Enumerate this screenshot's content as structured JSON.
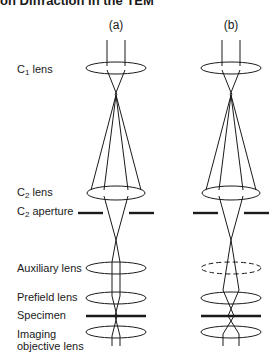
{
  "header": {
    "title": "on Diffraction in the TEM"
  },
  "panels": [
    {
      "id": "a",
      "label": "(a)",
      "center_x": 116,
      "auxiliary_lens_style": "solid"
    },
    {
      "id": "b",
      "label": "(b)",
      "center_x": 231,
      "auxiliary_lens_style": "dashed"
    }
  ],
  "labels": {
    "c1_lens": {
      "main": "C",
      "sub": "1",
      "rest": " lens"
    },
    "c2_lens": {
      "main": "C",
      "sub": "2",
      "rest": " lens"
    },
    "c2_aperture": {
      "main": "C",
      "sub": "2",
      "rest": " aperture"
    },
    "auxiliary_lens": "Auxiliary lens",
    "prefield_lens": "Prefield lens",
    "specimen": "Specimen",
    "imaging_objective_line1": "Imaging",
    "imaging_objective_line2": "objective lens"
  },
  "colors": {
    "line": "#1a1a1a",
    "background": "#ffffff"
  }
}
